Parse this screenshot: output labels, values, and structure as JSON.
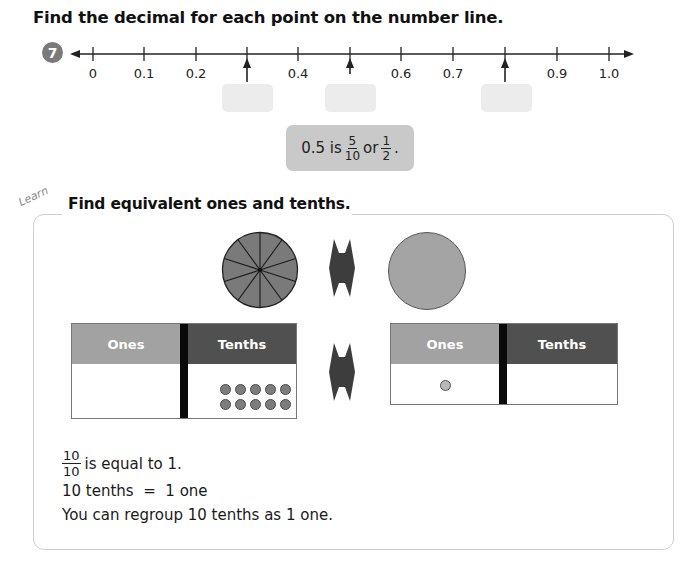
{
  "page": {
    "title": "Find the decimal for each point on the number line."
  },
  "question": {
    "number": "7",
    "number_line": {
      "labels": [
        "0",
        "0.1",
        "0.2",
        "0.4",
        "0.6",
        "0.7",
        "0.9",
        "1.0"
      ],
      "arrow_points": [
        "0.3",
        "0.5",
        "0.8"
      ],
      "answer_boxes": [
        "",
        "",
        ""
      ]
    },
    "hint": {
      "prefix": "0.5 is",
      "frac1_num": "5",
      "frac1_den": "10",
      "middle": "or",
      "frac2_num": "1",
      "frac2_den": "2",
      "suffix": "."
    }
  },
  "learn": {
    "tag": "Learn",
    "title": "Find equivalent ones and tenths.",
    "left_chart": {
      "ones_label": "Ones",
      "tenths_label": "Tenths",
      "ones_dots": 0,
      "tenths_dots": 10
    },
    "right_chart": {
      "ones_label": "Ones",
      "tenths_label": "Tenths",
      "ones_dots": 1,
      "tenths_dots": 0
    },
    "line1": {
      "frac_num": "10",
      "frac_den": "10",
      "text": "is equal to 1."
    },
    "line2": "10 tenths  =  1 one",
    "line3": "You can regroup 10 tenths as 1 one."
  },
  "colors": {
    "ones_header": "#a2a2a2",
    "tenths_header": "#505050",
    "hint_bg": "#c9c9c9",
    "answer_box": "#ececec",
    "split_circle": "#7a7a7a",
    "whole_circle": "#a4a4a4"
  }
}
